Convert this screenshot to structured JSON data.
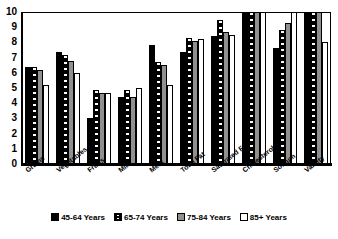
{
  "chart_data": {
    "type": "bar",
    "title": "",
    "subtitle": "",
    "xlabel": "",
    "ylabel": "",
    "ylim": [
      0,
      10
    ],
    "yticks": [
      0,
      1,
      2,
      3,
      4,
      5,
      6,
      7,
      8,
      9,
      10
    ],
    "grid": false,
    "legend_position": "bottom",
    "orientation": "vertical",
    "categories": [
      "Grains",
      "Vegetables",
      "Fruits",
      "Milk",
      "Meat",
      "Total Fat",
      "Saturated Fat",
      "Cholesterol",
      "Sodium",
      "Variety"
    ],
    "series": [
      {
        "name": "45-64 Years",
        "fill": "solid-black",
        "color": "#000000",
        "values": [
          6.4,
          7.4,
          3.0,
          4.4,
          7.8,
          7.4,
          8.4,
          10.0,
          7.6,
          10.0
        ]
      },
      {
        "name": "65-74 Years",
        "fill": "black-with-white-dots",
        "color": "#000000",
        "values": [
          6.4,
          7.2,
          4.9,
          4.9,
          6.7,
          8.3,
          9.5,
          10.0,
          8.8,
          10.0
        ]
      },
      {
        "name": "75-84 Years",
        "fill": "gray",
        "color": "#909090",
        "values": [
          6.2,
          6.8,
          4.7,
          4.4,
          6.5,
          8.1,
          8.7,
          10.0,
          9.3,
          10.0
        ]
      },
      {
        "name": "85+ Years",
        "fill": "white",
        "color": "#ffffff",
        "values": [
          5.2,
          6.0,
          4.7,
          5.0,
          5.2,
          8.2,
          8.5,
          10.0,
          10.0,
          8.0
        ]
      }
    ]
  },
  "legend": {
    "items": [
      {
        "label": "45-64 Years"
      },
      {
        "label": "65-74 Years"
      },
      {
        "label": "75-84 Years"
      },
      {
        "label": "85+ Years"
      }
    ]
  },
  "axis": {
    "y_labels": [
      "10",
      "9",
      "8",
      "7",
      "6",
      "5",
      "4",
      "3",
      "2",
      "1",
      "0"
    ]
  }
}
